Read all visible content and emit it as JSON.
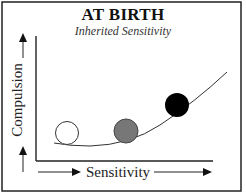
{
  "diagram": {
    "title": "AT BIRTH",
    "subtitle": "Inherited Sensitivity",
    "x_axis_label": "Sensitivity",
    "y_axis_label": "Compulsion",
    "curve": "upward-curving line (sensitivity vs. compulsion)",
    "balls": [
      {
        "name": "low-sensitivity-ball",
        "fill": "#ffffff"
      },
      {
        "name": "medium-sensitivity-ball",
        "fill": "#777777"
      },
      {
        "name": "high-sensitivity-ball",
        "fill": "#000000"
      }
    ],
    "colors": {
      "frame": "#222222",
      "line": "#333333"
    }
  }
}
